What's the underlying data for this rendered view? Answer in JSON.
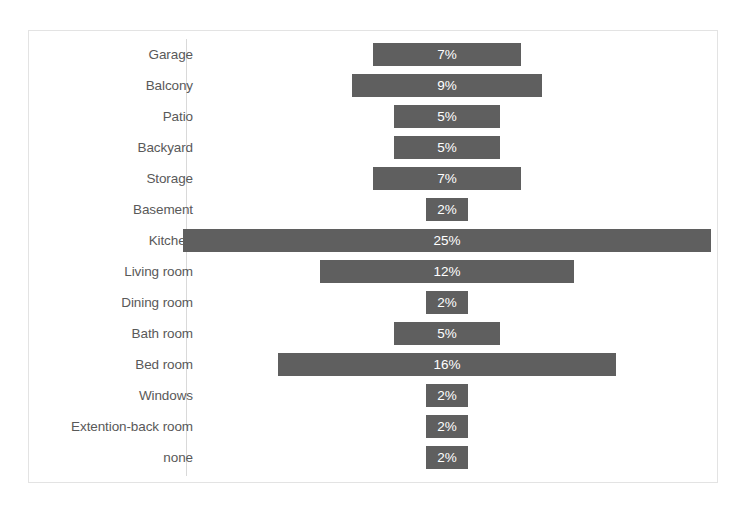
{
  "chart_data": {
    "type": "bar",
    "orientation": "horizontal-centered",
    "title": "",
    "subtitle": "",
    "xlabel": "",
    "ylabel": "",
    "grid": false,
    "legend": null,
    "axis_line_position": "category-axis-left",
    "value_suffix": "%",
    "categories": [
      "Garage",
      "Balcony",
      "Patio",
      "Backyard",
      "Storage",
      "Basement",
      "Kitchen",
      "Living room",
      "Dining room",
      "Bath room",
      "Bed room",
      "Windows",
      "Extention-back room",
      "none"
    ],
    "values": [
      7,
      9,
      5,
      5,
      7,
      2,
      25,
      12,
      2,
      5,
      16,
      2,
      2,
      2
    ],
    "data_labels": [
      "7%",
      "9%",
      "5%",
      "5%",
      "7%",
      "2%",
      "25%",
      "12%",
      "2%",
      "5%",
      "16%",
      "2%",
      "2%",
      "2%"
    ],
    "xlim": [
      0,
      25
    ],
    "colors": {
      "bar_fill": "#5f5f5f",
      "data_label_text": "#ffffff",
      "category_label_text": "#595959",
      "axis_line": "#d9d9d9",
      "plot_border": "#e3e3e3",
      "background": "#ffffff"
    }
  }
}
